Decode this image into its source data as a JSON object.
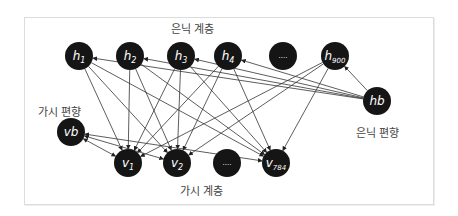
{
  "diagram": {
    "type": "RBM network diagram",
    "colors": {
      "node_fill": "#151515",
      "node_text": "#ffffff",
      "edge": "#333333",
      "label": "#444444",
      "frame_border": "#dcdcdc"
    },
    "labels": {
      "hidden_layer": "은닉 계층",
      "visible_layer": "가시 계층",
      "hidden_bias": "은닉 편향",
      "visible_bias": "가시 편향"
    },
    "hidden_nodes": [
      {
        "id": "h1",
        "base": "h",
        "sub": "1",
        "x": 79,
        "y": 56
      },
      {
        "id": "h2",
        "base": "h",
        "sub": "2",
        "x": 130,
        "y": 56
      },
      {
        "id": "h3",
        "base": "h",
        "sub": "3",
        "x": 181,
        "y": 56
      },
      {
        "id": "h4",
        "base": "h",
        "sub": "4",
        "x": 228,
        "y": 56
      },
      {
        "id": "hdots",
        "base": "....",
        "sub": "",
        "x": 283,
        "y": 56
      },
      {
        "id": "h900",
        "base": "h",
        "sub": "900",
        "x": 335,
        "y": 56
      }
    ],
    "visible_nodes": [
      {
        "id": "v1",
        "base": "v",
        "sub": "1",
        "x": 128,
        "y": 163
      },
      {
        "id": "v2",
        "base": "v",
        "sub": "2",
        "x": 177,
        "y": 163
      },
      {
        "id": "vdots",
        "base": "....",
        "sub": "",
        "x": 227,
        "y": 163
      },
      {
        "id": "v784",
        "base": "v",
        "sub": "784",
        "x": 276,
        "y": 163
      }
    ],
    "bias_nodes": [
      {
        "id": "hb",
        "base": "hb",
        "sub": "",
        "x": 377,
        "y": 101
      },
      {
        "id": "vb",
        "base": "vb",
        "sub": "",
        "x": 71,
        "y": 132
      }
    ]
  }
}
